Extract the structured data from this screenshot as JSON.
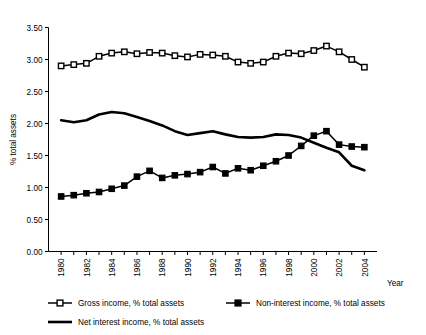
{
  "chart_data": {
    "type": "line",
    "title": "",
    "xlabel": "Year",
    "ylabel": "% total assets",
    "xlim": [
      1979,
      2005
    ],
    "ylim": [
      0.0,
      3.5
    ],
    "ytick_labels": [
      "0.00",
      "0.50",
      "1.00",
      "1.50",
      "2.00",
      "2.50",
      "3.00",
      "3.50"
    ],
    "ytick_values": [
      0.0,
      0.5,
      1.0,
      1.5,
      2.0,
      2.5,
      3.0,
      3.5
    ],
    "xtick_labels": [
      "1980",
      "1982",
      "1984",
      "1986",
      "1988",
      "1990",
      "1992",
      "1994",
      "1996",
      "1998",
      "2000",
      "2002",
      "2004"
    ],
    "xtick_values": [
      1980,
      1982,
      1984,
      1986,
      1988,
      1990,
      1992,
      1994,
      1996,
      1998,
      2000,
      2002,
      2004
    ],
    "x": [
      1980,
      1981,
      1982,
      1983,
      1984,
      1985,
      1986,
      1987,
      1988,
      1989,
      1990,
      1991,
      1992,
      1993,
      1994,
      1995,
      1996,
      1997,
      1998,
      1999,
      2000,
      2001,
      2002,
      2003,
      2004
    ],
    "grid": false,
    "legend_position": "below",
    "series": [
      {
        "name": "Gross income, % total assets",
        "marker": "open-square",
        "line": "solid",
        "values": [
          2.9,
          2.92,
          2.94,
          3.05,
          3.1,
          3.12,
          3.09,
          3.11,
          3.1,
          3.06,
          3.04,
          3.08,
          3.07,
          3.05,
          2.96,
          2.94,
          2.96,
          3.05,
          3.1,
          3.09,
          3.14,
          3.21,
          3.12,
          3.0,
          2.88
        ]
      },
      {
        "name": "Net interest income, % total assets",
        "marker": "none",
        "line": "solid-thick",
        "values": [
          2.05,
          2.02,
          2.05,
          2.14,
          2.18,
          2.16,
          2.1,
          2.04,
          1.97,
          1.88,
          1.82,
          1.85,
          1.88,
          1.83,
          1.79,
          1.78,
          1.79,
          1.83,
          1.82,
          1.78,
          1.7,
          1.62,
          1.55,
          1.34,
          1.27
        ]
      },
      {
        "name": "Non-interest income, % total assets",
        "marker": "filled-square",
        "line": "solid",
        "values": [
          0.86,
          0.88,
          0.91,
          0.93,
          0.98,
          1.03,
          1.17,
          1.26,
          1.15,
          1.19,
          1.21,
          1.24,
          1.32,
          1.22,
          1.3,
          1.27,
          1.34,
          1.41,
          1.5,
          1.65,
          1.81,
          1.88,
          1.67,
          1.64,
          1.63
        ]
      }
    ]
  },
  "legend": {
    "items": [
      {
        "label": "Gross income, % total assets",
        "style": "open-square"
      },
      {
        "label": "Non-interest income, % total assets",
        "style": "filled-square"
      },
      {
        "label": "Net interest income, % total assets",
        "style": "plain-line"
      }
    ]
  }
}
